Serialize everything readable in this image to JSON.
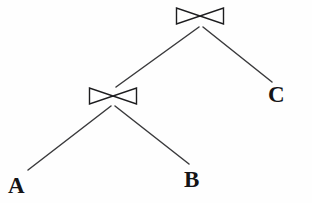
{
  "diagram": {
    "background_color": "#fefefe",
    "edge_color": "#3a3a3c",
    "node_stroke_color": "#1d1d1f",
    "label_color": "#141416",
    "operator_symbol": "⋈",
    "operator_name": "join",
    "nodes": [
      {
        "id": "root-join",
        "type": "operator",
        "label": "⋈",
        "name": "join",
        "x": 200,
        "y": 16,
        "width": 48,
        "height": 17
      },
      {
        "id": "inner-join",
        "type": "operator",
        "label": "⋈",
        "name": "join",
        "x": 113,
        "y": 96,
        "width": 48,
        "height": 17
      },
      {
        "id": "leaf-a",
        "type": "relation",
        "label": "A",
        "x": 17,
        "y": 186
      },
      {
        "id": "leaf-b",
        "type": "relation",
        "label": "B",
        "x": 193,
        "y": 180
      },
      {
        "id": "leaf-c",
        "type": "relation",
        "label": "C",
        "x": 277,
        "y": 95
      }
    ],
    "edges": [
      {
        "from": "root-join",
        "to": "inner-join",
        "x1": 199,
        "y1": 27,
        "x2": 116,
        "y2": 87
      },
      {
        "from": "root-join",
        "to": "leaf-c",
        "x1": 203,
        "y1": 27,
        "x2": 272,
        "y2": 82
      },
      {
        "from": "inner-join",
        "to": "leaf-a",
        "x1": 111,
        "y1": 106,
        "x2": 28,
        "y2": 170
      },
      {
        "from": "inner-join",
        "to": "leaf-b",
        "x1": 115,
        "y1": 106,
        "x2": 189,
        "y2": 164
      }
    ]
  }
}
